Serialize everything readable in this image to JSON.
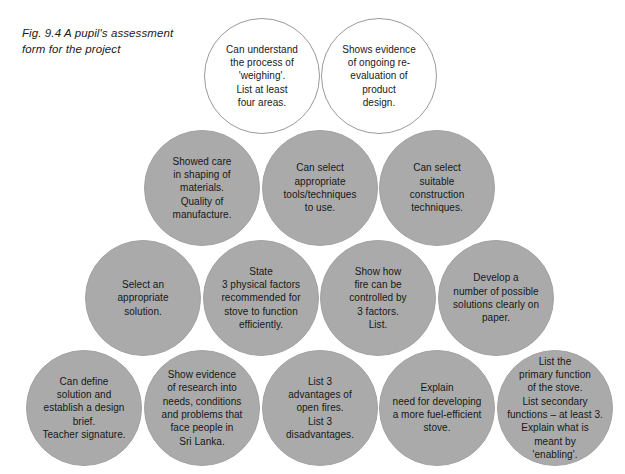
{
  "figure": {
    "caption": "Fig. 9.4    A pupil's assessment\nform for the project",
    "colors": {
      "bubble_gray": "#a9aaa9",
      "bubble_white": "#ffffff",
      "outline": "#9a9a9a",
      "text": "#17181a",
      "background": "#ffffff"
    },
    "rows": [
      {
        "row_name": "row-1",
        "style": "white",
        "bubbles": [
          {
            "text": "Can understand\nthe process of\n'weighing'.\nList at least\nfour areas."
          },
          {
            "text": "Shows evidence\nof ongoing re-\nevaluation of\nproduct\ndesign."
          }
        ]
      },
      {
        "row_name": "row-2",
        "style": "gray",
        "bubbles": [
          {
            "text": "Showed care\nin shaping of\nmaterials.\nQuality of\nmanufacture."
          },
          {
            "text": "Can select\nappropriate\ntools/techniques\nto use."
          },
          {
            "text": "Can select\nsuitable\nconstruction\ntechniques."
          }
        ]
      },
      {
        "row_name": "row-3",
        "style": "gray",
        "bubbles": [
          {
            "text": "Select an\nappropriate\nsolution."
          },
          {
            "text": "State\n3 physical factors\nrecommended for\nstove to function\nefficiently."
          },
          {
            "text": "Show how\nfire can be\ncontrolled by\n3 factors.\nList."
          },
          {
            "text": "Develop a\nnumber of possible\nsolutions clearly on\npaper."
          }
        ]
      },
      {
        "row_name": "row-4",
        "style": "gray",
        "bubbles": [
          {
            "text": "Can define\nsolution and\nestablish a design\nbrief.\nTeacher signature."
          },
          {
            "text": "Show evidence\nof research into\nneeds, conditions\nand problems that\nface people in\nSri Lanka."
          },
          {
            "text": "List 3\nadvantages of\nopen fires.\nList 3\ndisadvantages."
          },
          {
            "text": "Explain\nneed for developing\na more fuel-efficient\nstove."
          },
          {
            "text": "List the\nprimary function\nof the stove.\nList secondary\nfunctions – at least 3.\nExplain what is\nmeant by\n'enabling'."
          }
        ]
      }
    ]
  }
}
